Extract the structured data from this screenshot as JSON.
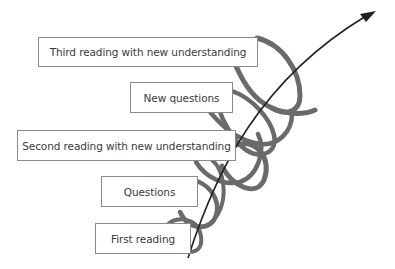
{
  "diagram": {
    "type": "spiral-process",
    "colors": {
      "spiral": "#6a6a6a",
      "arrow": "#222222",
      "box_border": "#8a8a8a",
      "text": "#3a3a3a"
    },
    "stages": [
      {
        "label": "First reading"
      },
      {
        "label": "Questions"
      },
      {
        "label": "Second reading with new understanding"
      },
      {
        "label": "New questions"
      },
      {
        "label": "Third reading with new understanding"
      }
    ],
    "arrow": {
      "direction": "up-right",
      "icon": "arrow-icon"
    }
  }
}
